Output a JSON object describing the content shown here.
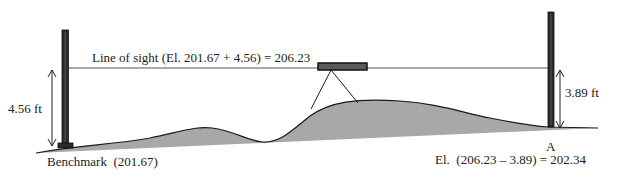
{
  "diagram": {
    "type": "leveling survey (differential leveling) cross-section",
    "labels": {
      "line_of_sight": "Line of sight (El. 201.67 + 4.56) = 206.23",
      "backsight_height": "4.56 ft",
      "foresight_height": "3.89 ft",
      "benchmark": "Benchmark  (201.67)",
      "point_a": "A",
      "point_a_elevation": "El.  (206.23 – 3.89) = 202.34"
    },
    "values": {
      "benchmark_elevation": 201.67,
      "backsight_reading_ft": 4.56,
      "line_of_sight_elevation": 206.23,
      "foresight_reading_ft": 3.89,
      "point_a_elevation": 202.34
    },
    "colors": {
      "ground_fill": "#a8a8a8",
      "outline": "#1a1a1a",
      "rod": "#2a2a2a",
      "instrument": "#4a4a4a",
      "line_of_sight": "#555555"
    }
  }
}
